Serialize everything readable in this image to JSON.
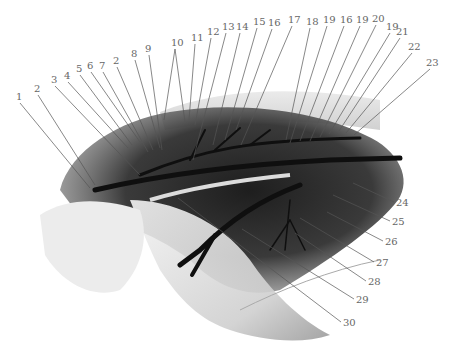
{
  "figure": {
    "type": "anatomical illustration",
    "footnote_mark": "ト s",
    "labels_top": [
      {
        "text": "1",
        "x": 16,
        "y": 92,
        "tx": 90,
        "ty": 188
      },
      {
        "text": "2",
        "x": 34,
        "y": 84,
        "tx": 95,
        "ty": 185
      },
      {
        "text": "3",
        "x": 51,
        "y": 75,
        "tx": 140,
        "ty": 175
      },
      {
        "text": "4",
        "x": 64,
        "y": 71,
        "tx": 128,
        "ty": 148
      },
      {
        "text": "5",
        "x": 76,
        "y": 64,
        "tx": 132,
        "ty": 145
      },
      {
        "text": "6",
        "x": 87,
        "y": 61,
        "tx": 140,
        "ty": 142
      },
      {
        "text": "7",
        "x": 99,
        "y": 61,
        "tx": 148,
        "ty": 152
      },
      {
        "text": "2",
        "x": 113,
        "y": 56,
        "tx": 153,
        "ty": 150
      },
      {
        "text": "8",
        "x": 131,
        "y": 49,
        "tx": 160,
        "ty": 148
      },
      {
        "text": "9",
        "x": 145,
        "y": 44,
        "tx": 162,
        "ty": 150
      },
      {
        "text": "10",
        "x": 171,
        "y": 38,
        "tx": 164,
        "ty": 120
      },
      {
        "text": "11",
        "x": 191,
        "y": 33,
        "tx": 189,
        "ty": 120
      },
      {
        "text": "12",
        "x": 207,
        "y": 27,
        "tx": 195,
        "ty": 125
      },
      {
        "text": "13",
        "x": 222,
        "y": 22,
        "tx": 193,
        "ty": 160
      },
      {
        "text": "14",
        "x": 236,
        "y": 22,
        "tx": 213,
        "ty": 145
      },
      {
        "text": "15",
        "x": 253,
        "y": 17,
        "tx": 225,
        "ty": 140
      },
      {
        "text": "16",
        "x": 268,
        "y": 18,
        "tx": 236,
        "ty": 130
      },
      {
        "text": "17",
        "x": 288,
        "y": 15,
        "tx": 241,
        "ty": 145
      },
      {
        "text": "18",
        "x": 306,
        "y": 17,
        "tx": 286,
        "ty": 140
      },
      {
        "text": "19",
        "x": 323,
        "y": 15,
        "tx": 290,
        "ty": 143
      },
      {
        "text": "16",
        "x": 340,
        "y": 15,
        "tx": 300,
        "ty": 141
      },
      {
        "text": "19",
        "x": 356,
        "y": 15,
        "tx": 310,
        "ty": 141
      },
      {
        "text": "20",
        "x": 372,
        "y": 14,
        "tx": 320,
        "ty": 137
      },
      {
        "text": "19",
        "x": 386,
        "y": 22,
        "tx": 329,
        "ty": 134
      },
      {
        "text": "21",
        "x": 396,
        "y": 27,
        "tx": 339,
        "ty": 131
      },
      {
        "text": "22",
        "x": 408,
        "y": 42,
        "tx": 346,
        "ty": 133
      },
      {
        "text": "23",
        "x": 426,
        "y": 58,
        "tx": 354,
        "ty": 135
      }
    ],
    "labels_right": [
      {
        "text": "24",
        "x": 396,
        "y": 198,
        "tx": 353,
        "ty": 183
      },
      {
        "text": "25",
        "x": 392,
        "y": 217,
        "tx": 333,
        "ty": 195
      },
      {
        "text": "26",
        "x": 385,
        "y": 237,
        "tx": 327,
        "ty": 212
      },
      {
        "text": "27",
        "x": 376,
        "y": 258,
        "tx": 300,
        "ty": 218
      },
      {
        "text": "28",
        "x": 368,
        "y": 277,
        "tx": 295,
        "ty": 233
      },
      {
        "text": "29",
        "x": 356,
        "y": 295,
        "tx": 242,
        "ty": 229
      },
      {
        "text": "30",
        "x": 343,
        "y": 318,
        "tx": 178,
        "ty": 198
      }
    ]
  }
}
